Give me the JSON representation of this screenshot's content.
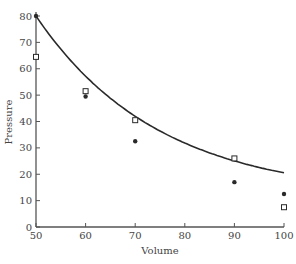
{
  "chart_data": {
    "type": "scatter",
    "title": "",
    "xlabel": "Volume",
    "ylabel": "Pressure",
    "xlim": [
      50,
      100
    ],
    "ylim": [
      0,
      80
    ],
    "xticks": [
      50,
      60,
      70,
      80,
      90,
      100
    ],
    "yticks": [
      0,
      10,
      20,
      30,
      40,
      50,
      60,
      70,
      80
    ],
    "grid": false,
    "legend": null,
    "series": [
      {
        "name": "fitted curve points",
        "marker": "filled-circle",
        "line": "smooth curve",
        "x": [
          50,
          60,
          70,
          90,
          100
        ],
        "y": [
          80,
          49.5,
          32.5,
          17,
          12.5
        ]
      },
      {
        "name": "observed",
        "marker": "open-square",
        "x": [
          50,
          60,
          70,
          90,
          100
        ],
        "y": [
          64.5,
          51.5,
          40.5,
          26,
          7.5
        ]
      }
    ],
    "colors": {
      "line": "#2a2a2a",
      "axis": "#555555",
      "text": "#444444"
    }
  }
}
